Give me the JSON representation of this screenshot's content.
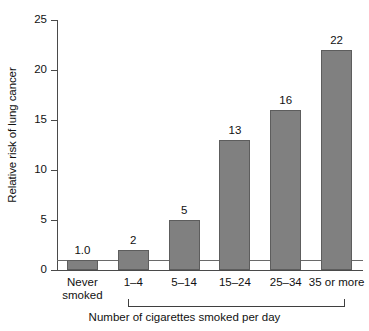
{
  "chart_data": {
    "type": "bar",
    "title": "",
    "xlabel": "Number of cigarettes smoked per day",
    "ylabel": "Relative risk of lung cancer",
    "categories": [
      "Never\nsmoked",
      "1–4",
      "5–14",
      "15–24",
      "25–34",
      "35 or more"
    ],
    "values": [
      1.0,
      2,
      5,
      13,
      16,
      22
    ],
    "value_labels": [
      "1.0",
      "2",
      "5",
      "13",
      "16",
      "22"
    ],
    "ylim": [
      0,
      25
    ],
    "yticks": [
      0,
      5,
      10,
      15,
      20,
      25
    ],
    "ytick_labels": [
      "0",
      "5",
      "10",
      "15",
      "20",
      "25"
    ],
    "grid": false,
    "legend": "none",
    "reference_line": {
      "value": 1.0,
      "label": ""
    },
    "bar_color": "#808080",
    "bar_edge_color": "#5d5d5d",
    "axis_color": "#4a4a4a",
    "bracket_spans_categories": [
      "1–4",
      "35 or more"
    ]
  }
}
